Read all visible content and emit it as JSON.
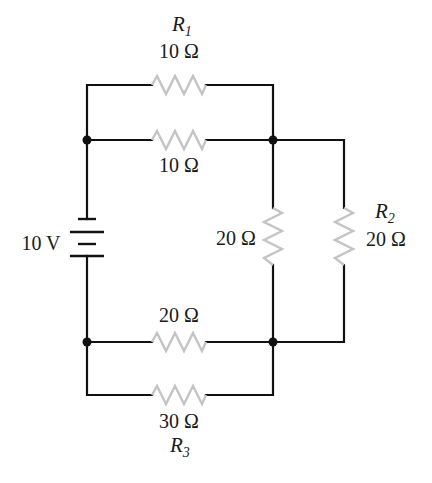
{
  "diagram": {
    "type": "circuit-schematic",
    "colors": {
      "wire": "#111111",
      "resistor": "#c4c4c4",
      "text": "#1a1a1a",
      "background": "#ffffff"
    },
    "battery": {
      "label": "10 V"
    },
    "resistors": {
      "r1": {
        "name": "R",
        "subscript": "1",
        "value": "10 Ω"
      },
      "top_middle": {
        "value": "10 Ω"
      },
      "vertical_inner": {
        "value": "20 Ω"
      },
      "r2": {
        "name": "R",
        "subscript": "2",
        "value": "20 Ω"
      },
      "bottom_middle": {
        "value": "20 Ω"
      },
      "r3": {
        "name": "R",
        "subscript": "3",
        "value": "30 Ω"
      }
    }
  }
}
